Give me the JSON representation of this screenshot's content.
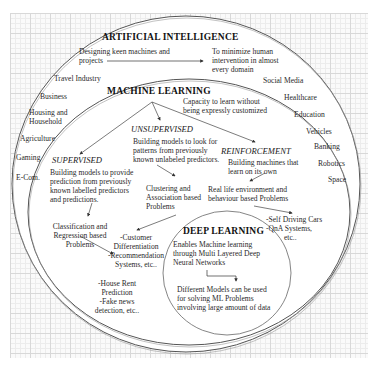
{
  "ai": {
    "title": "ARTIFICIAL INTELLIGENCE",
    "desc_line1": "Designing keen machines and",
    "desc_line2": "projects",
    "goal_line1": "To minimize human",
    "goal_line2": "intervention in almost",
    "goal_line3": "every domain",
    "domains_left": [
      "Travel Industry",
      "Business",
      "Housing and",
      "Household",
      "Agriculture",
      "Gaming",
      "E-Com."
    ],
    "domains_right": [
      "Social  Media",
      "Healthcare",
      "Education",
      "Vehicles",
      "Banking",
      "Robotics",
      "Space"
    ]
  },
  "ml": {
    "title": "MACHINE LEARNING",
    "desc_line1": "Capacity to learn without",
    "desc_line2": "being expressly customized",
    "supervised": {
      "title": "SUPERVISED",
      "lines": [
        "Building models to provide",
        "prediction from previously",
        "known labelled predictors",
        "and predictions."
      ],
      "problems": [
        "Classification and",
        "Regression based",
        "Problems"
      ],
      "examples": [
        "-House Rent",
        "Prediction",
        "-Fake news",
        "detection, etc.."
      ]
    },
    "unsupervised": {
      "title": "UNSUPERVISED",
      "lines": [
        "Building models to look for",
        "patterns from previously",
        "known unlabeled predictors."
      ],
      "problems": [
        "Clustering and",
        "Association based",
        "Problems"
      ],
      "examples": [
        "-Customer",
        "Differentiation",
        "-Recommendation",
        "Systems, etc.."
      ]
    },
    "reinforcement": {
      "title": "REINFORCEMENT",
      "lines": [
        "Building machines that",
        "learn on its own"
      ],
      "problems": [
        "Real life environment and",
        "behaviour based Problems"
      ],
      "examples": [
        "-Self Driving Cars",
        "-QnA Systems,",
        "etc.."
      ]
    }
  },
  "dl": {
    "title": "DEEP LEARNING",
    "lines": [
      "Enables Machine learning",
      "through Multi Layered Deep",
      "Neural Networks"
    ],
    "result": [
      "Different Models can be used",
      "for solving ML Problems",
      "involving large amount of data"
    ]
  },
  "colors": {
    "line": "#555555",
    "grid_major": "#d8d8d8",
    "grid_minor": "#ececec",
    "fill": "#ffffff"
  }
}
